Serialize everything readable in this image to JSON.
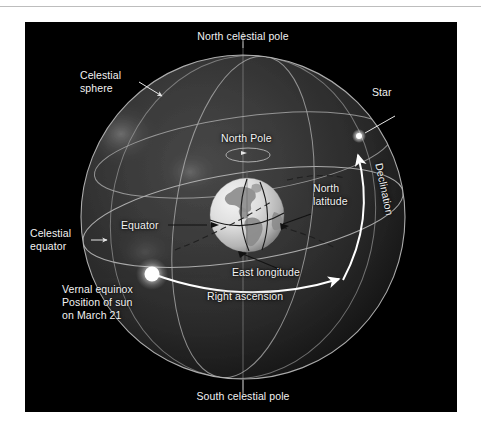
{
  "figure": {
    "background_color": "#000000",
    "page_background": "#ffffff",
    "sphere_name": "celestial-sphere-diagram",
    "colors": {
      "label_text": "#f2f2f2",
      "celestial_sphere_fill": "#2a2a2a",
      "great_circle_line": "#c9c9c9",
      "highlight_arc": "#ffffff",
      "sun_glow": "#ffffff",
      "star": "#ffffff",
      "earth_ocean": "#d8d8d8",
      "earth_land": "#8f8f8f",
      "axis_line": "#9a9a9a"
    },
    "labels": {
      "north_celestial_pole": "North celestial pole",
      "south_celestial_pole": "South celestial pole",
      "celestial_sphere_line1": "Celestial",
      "celestial_sphere_line2": "sphere",
      "celestial_equator_line1": "Celestial",
      "celestial_equator_line2": "equator",
      "star": "Star",
      "declination": "Declination",
      "north_pole": "North Pole",
      "north_latitude_line1": "North",
      "north_latitude_line2": "latitude",
      "equator": "Equator",
      "east_longitude": "East longitude",
      "right_ascension": "Right ascension",
      "vernal_equinox_line1": "Vernal equinox",
      "vernal_equinox_line2": "Position of sun",
      "vernal_equinox_line3": "on March 21"
    }
  }
}
